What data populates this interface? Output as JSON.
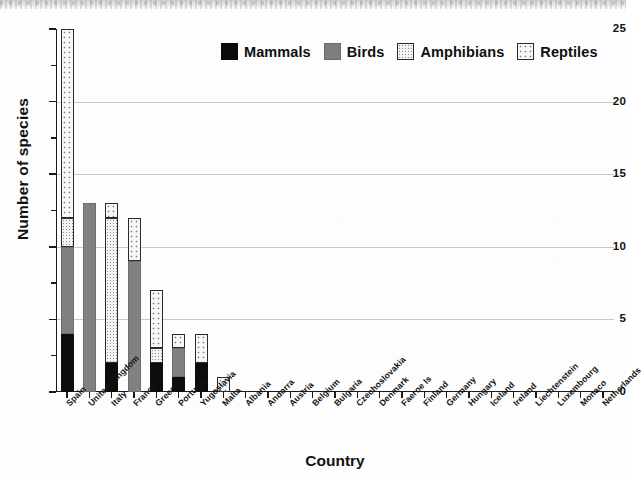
{
  "scan": {
    "top_band_note": "cut-off line of text at top edge of scanned page"
  },
  "chart_data": {
    "type": "bar",
    "subtype": "stacked-vertical",
    "title": "",
    "xlabel": "Country",
    "ylabel": "Number of species",
    "ylim": [
      0,
      25
    ],
    "ytick_values": [
      0,
      5,
      10,
      15,
      20,
      25
    ],
    "ytick_labels": [
      "0",
      "5",
      "10",
      "15",
      "20",
      "25"
    ],
    "yminor_tick_values": [
      2.5,
      7.5,
      12.5,
      17.5,
      22.5
    ],
    "grid": "horizontal-major-only",
    "gridline_values": [
      5,
      10,
      15,
      20
    ],
    "legend_position": "upper-center",
    "categories": [
      "Spain",
      "United Kingdom",
      "Italy",
      "France",
      "Greece",
      "Portugal",
      "Yugoslavia",
      "Malta",
      "Albania",
      "Andorra",
      "Austria",
      "Belgium",
      "Bulgaria",
      "Czechoslovakia",
      "Denmark",
      "Faeroe Is",
      "Finland",
      "Germany",
      "Hungary",
      "Iceland",
      "Ireland",
      "Liechtenstein",
      "Luxembourg",
      "Monaco",
      "Netherlands"
    ],
    "series": [
      {
        "name": "Mammals",
        "color": "#0d0d0d",
        "pattern": "solid-black",
        "values": [
          4,
          0,
          2,
          0,
          2,
          1,
          2,
          0,
          0,
          0,
          0,
          0,
          0,
          0,
          0,
          0,
          0,
          0,
          0,
          0,
          0,
          0,
          0,
          0,
          0
        ]
      },
      {
        "name": "Birds",
        "color": "#818181",
        "pattern": "solid-gray",
        "values": [
          6,
          13,
          0,
          9,
          0,
          2,
          0,
          0,
          0,
          0,
          0,
          0,
          0,
          0,
          0,
          0,
          0,
          0,
          0,
          0,
          0,
          0,
          0,
          0,
          0
        ]
      },
      {
        "name": "Amphibians",
        "color": "#f3f3f3",
        "pattern": "fine-dots",
        "values": [
          2,
          0,
          10,
          0,
          1,
          0,
          0,
          0,
          0,
          0,
          0,
          0,
          0,
          0,
          0,
          0,
          0,
          0,
          0,
          0,
          0,
          0,
          0,
          0,
          0
        ]
      },
      {
        "name": "Reptiles",
        "color": "#f7f7f7",
        "pattern": "coarse-dots",
        "values": [
          13,
          0,
          1,
          3,
          4,
          1,
          2,
          1,
          0,
          0,
          0,
          0,
          0,
          0,
          0,
          0,
          0,
          0,
          0,
          0,
          0,
          0,
          0,
          0,
          0
        ]
      }
    ],
    "totals": [
      25,
      13,
      13,
      12,
      7,
      4,
      4,
      1,
      0,
      0,
      0,
      0,
      0,
      0,
      0,
      0,
      0,
      0,
      0,
      0,
      0,
      0,
      0,
      0,
      0
    ]
  },
  "legend": {
    "items": [
      {
        "label": "Mammals",
        "key": "mammals"
      },
      {
        "label": "Birds",
        "key": "birds"
      },
      {
        "label": "Amphibians",
        "key": "amphibians"
      },
      {
        "label": "Reptiles",
        "key": "reptiles"
      }
    ]
  }
}
